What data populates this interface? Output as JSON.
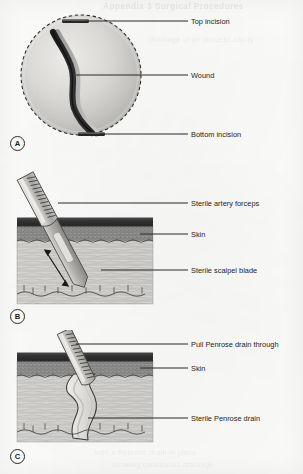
{
  "figure": {
    "ghost_top": "Appendix 3 Surgical Procedures",
    "ghost_mid": "drainage of an abscess cavity",
    "ghost_bottom_1": "with a Penrose drain in place",
    "ghost_bottom_2": "allowing continuous drainage"
  },
  "colors": {
    "epidermis": "#3a3a3a",
    "dermis": "#8d8d8d",
    "subcutaneous": "#d6d6d4",
    "instrument": "#b9b9b7",
    "wound": "#2e2e2e",
    "leader": "#2a2a2a",
    "text": "#1d1d1d",
    "drain": "#e6e5e1"
  },
  "panels": [
    {
      "id": "A",
      "badge": "A",
      "caption": "Wound with top and bottom incisions",
      "labels": [
        {
          "name": "top-incision",
          "text": "Top incision"
        },
        {
          "name": "wound",
          "text": "Wound"
        },
        {
          "name": "bottom-incision",
          "text": "Bottom incision"
        }
      ]
    },
    {
      "id": "B",
      "badge": "B",
      "caption": "Scalpel blade and artery forceps inserted through skin",
      "labels": [
        {
          "name": "sterile-artery-forceps",
          "text": "Sterile artery forceps"
        },
        {
          "name": "skin",
          "text": "Skin"
        },
        {
          "name": "sterile-scalpel-blade",
          "text": "Sterile scalpel blade"
        }
      ]
    },
    {
      "id": "C",
      "badge": "C",
      "caption": "Penrose drain pulled through the tract",
      "labels": [
        {
          "name": "pull-penrose-drain-through",
          "text": "Pull Penrose drain through"
        },
        {
          "name": "skin",
          "text": "Skin"
        },
        {
          "name": "sterile-penrose-drain",
          "text": "Sterile Penrose drain"
        }
      ]
    }
  ]
}
